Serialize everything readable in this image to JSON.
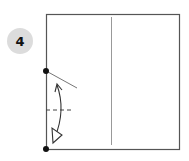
{
  "step": {
    "number": "4"
  },
  "diagram": {
    "square": {
      "x": 46,
      "y": 14,
      "w": 133,
      "h": 135,
      "stroke": "#555555"
    },
    "center_crease": {
      "x": 111,
      "y1": 17,
      "y2": 145,
      "stroke": "#999999"
    },
    "points": [
      {
        "x": 46,
        "y": 71
      },
      {
        "x": 46,
        "y": 149
      }
    ],
    "colors": {
      "badge": "#dcdcdc",
      "line": "#333333"
    }
  }
}
